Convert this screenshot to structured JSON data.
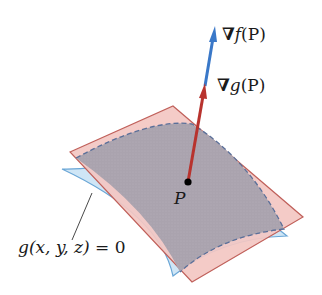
{
  "figure": {
    "type": "gradient-parallel-diagram",
    "labels": {
      "grad_f": {
        "nabla": "∇",
        "func": "f",
        "arg": "(P)"
      },
      "grad_g": {
        "nabla": "∇",
        "func": "g",
        "arg": "(P)"
      },
      "point": "P",
      "surface": "g(x, y, z) = 0",
      "surface_parts": {
        "func": "g",
        "args": "(x, y, z)",
        "eq": " = 0"
      }
    },
    "colors": {
      "grad_f_arrow": "#3a78c8",
      "grad_g_arrow": "#b8332e",
      "tangent_plane_fill": "#f2c4c0",
      "tangent_plane_edge": "#c0605a",
      "surface_fill": "#cfe6f6",
      "surface_edge": "#6aa6d6",
      "overlap_fill": "#a9a2ad",
      "dashed_boundary": "#5a6f99",
      "point": "#000000"
    }
  }
}
